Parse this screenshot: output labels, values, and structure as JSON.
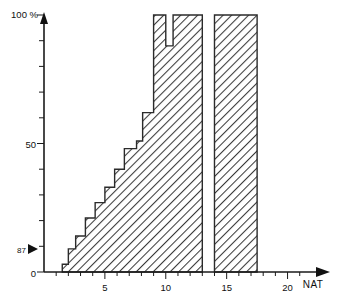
{
  "chart_data": {
    "type": "area",
    "title": "",
    "subtitle": "",
    "xlabel": "NAT",
    "ylabel": "100 %",
    "ylim": [
      0,
      100
    ],
    "xlim": [
      0,
      22.5
    ],
    "grid": false,
    "legend": null,
    "y_axis": {
      "unit_label": "100 %",
      "top_label": "100 %",
      "mid_label": "50",
      "zero_label": "0",
      "marker_label": "87",
      "marker_value": 8.7,
      "tick_values": [
        0,
        10,
        20,
        30,
        40,
        50,
        60,
        70,
        80,
        90,
        100
      ],
      "labeled_ticks": [
        {
          "value": 100,
          "text": "100 %"
        },
        {
          "value": 50,
          "text": "50"
        },
        {
          "value": 8.7,
          "text": "87"
        },
        {
          "value": 0,
          "text": "0"
        }
      ]
    },
    "x_axis": {
      "tick_values": [
        1,
        2,
        3,
        4,
        5,
        6,
        7,
        8,
        9,
        10,
        11,
        12,
        13,
        14,
        15,
        16,
        17,
        18,
        19,
        20,
        21
      ],
      "labeled_ticks": [
        {
          "value": 5,
          "text": "5"
        },
        {
          "value": 10,
          "text": "10"
        },
        {
          "value": 15,
          "text": "15"
        },
        {
          "value": 20,
          "text": "20"
        }
      ],
      "axis_title": "NAT"
    },
    "steps": [
      {
        "x0": 1.5,
        "x1": 2.0,
        "y": 3
      },
      {
        "x0": 2.0,
        "x1": 2.6,
        "y": 9
      },
      {
        "x0": 2.6,
        "x1": 3.4,
        "y": 14
      },
      {
        "x0": 3.4,
        "x1": 4.2,
        "y": 21
      },
      {
        "x0": 4.2,
        "x1": 5.0,
        "y": 27
      },
      {
        "x0": 5.0,
        "x1": 5.8,
        "y": 33
      },
      {
        "x0": 5.8,
        "x1": 6.6,
        "y": 40
      },
      {
        "x0": 6.6,
        "x1": 7.6,
        "y": 48
      },
      {
        "x0": 7.6,
        "x1": 8.1,
        "y": 51
      },
      {
        "x0": 8.1,
        "x1": 9.0,
        "y": 62
      },
      {
        "x0": 9.0,
        "x1": 10.0,
        "y": 100
      },
      {
        "x0": 10.0,
        "x1": 10.6,
        "y": 88
      },
      {
        "x0": 10.6,
        "x1": 13.0,
        "y": 100
      }
    ],
    "second_block": {
      "x0": 14.0,
      "x1": 17.5,
      "y": 100
    },
    "gap": {
      "x0": 13.0,
      "x1": 14.0
    }
  }
}
